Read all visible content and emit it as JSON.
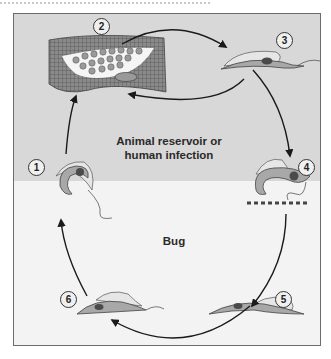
{
  "diagram": {
    "type": "life-cycle",
    "regions": {
      "upper_label": "Animal reservoir or human infection",
      "lower_label": "Bug"
    },
    "stages": [
      {
        "id": 1,
        "label": "1"
      },
      {
        "id": 2,
        "label": "2"
      },
      {
        "id": 3,
        "label": "3"
      },
      {
        "id": 4,
        "label": "4"
      },
      {
        "id": 5,
        "label": "5"
      },
      {
        "id": 6,
        "label": "6"
      }
    ],
    "colors": {
      "upper_bg": "#d8d8d8",
      "lower_bg": "#f3f3f3",
      "arrow": "#1a1a1a",
      "organism_body": "#a9a9a9",
      "nucleus": "#4a4a4a"
    }
  }
}
